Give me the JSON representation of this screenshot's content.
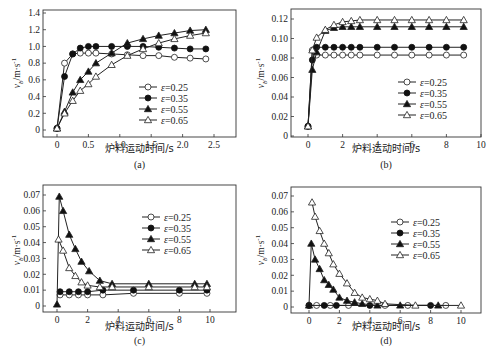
{
  "chart_data": [
    {
      "id": "a",
      "type": "line",
      "caption": "(a)",
      "xlabel": "炉料运动时间/s",
      "ylabel": "v_b/m·s^-1",
      "xlim": [
        -0.25,
        2.85
      ],
      "ylim": [
        -0.08,
        1.45
      ],
      "xticks": [
        0,
        0.5,
        1.0,
        1.5,
        2.0,
        2.5
      ],
      "xtick_labels": [
        "0",
        "0.5",
        "1.0",
        "1.5",
        "2.0",
        "2.5"
      ],
      "yticks": [
        0,
        0.2,
        0.4,
        0.6,
        0.8,
        1.0,
        1.2,
        1.4
      ],
      "ytick_labels": [
        "0",
        "0.2",
        "0.4",
        "0.6",
        "0.8",
        "1.0",
        "1.2",
        "1.4"
      ],
      "legend_position": "center-right",
      "series": [
        {
          "name": "ε=0.25",
          "marker": "open-circle",
          "x": [
            0,
            0.12,
            0.25,
            0.37,
            0.5,
            0.62,
            0.87,
            1.12,
            1.37,
            1.62,
            1.87,
            2.12,
            2.37
          ],
          "y": [
            0.02,
            0.8,
            0.91,
            0.92,
            0.92,
            0.92,
            0.91,
            0.9,
            0.89,
            0.89,
            0.87,
            0.86,
            0.85
          ]
        },
        {
          "name": "ε=0.35",
          "marker": "filled-circle",
          "x": [
            0,
            0.12,
            0.25,
            0.37,
            0.5,
            0.62,
            0.87,
            1.12,
            1.37,
            1.62,
            1.87,
            2.12,
            2.37
          ],
          "y": [
            0.02,
            0.64,
            0.91,
            0.98,
            1.0,
            1.0,
            1.0,
            1.0,
            1.0,
            0.99,
            0.98,
            0.97,
            0.97
          ]
        },
        {
          "name": "ε=0.55",
          "marker": "filled-triangle",
          "x": [
            0,
            0.12,
            0.25,
            0.37,
            0.5,
            0.62,
            0.87,
            1.12,
            1.37,
            1.62,
            1.87,
            2.12,
            2.37
          ],
          "y": [
            0.02,
            0.22,
            0.45,
            0.6,
            0.7,
            0.8,
            0.92,
            1.04,
            1.09,
            1.13,
            1.16,
            1.19,
            1.2
          ]
        },
        {
          "name": "ε=0.65",
          "marker": "open-triangle",
          "x": [
            0,
            0.12,
            0.25,
            0.37,
            0.5,
            0.62,
            0.87,
            1.12,
            1.37,
            1.62,
            1.87,
            2.12,
            2.37
          ],
          "y": [
            0.02,
            0.2,
            0.35,
            0.47,
            0.55,
            0.64,
            0.78,
            0.89,
            0.97,
            1.04,
            1.09,
            1.13,
            1.16
          ]
        }
      ]
    },
    {
      "id": "b",
      "type": "line",
      "caption": "(b)",
      "xlabel": "炉料运动时间/s",
      "ylabel": "v_b/m·s^-1",
      "xlim": [
        -1,
        10
      ],
      "ylim": [
        0,
        0.13
      ],
      "xticks": [
        0,
        2,
        4,
        6,
        8,
        10
      ],
      "xtick_labels": [
        "0",
        "2",
        "4",
        "6",
        "8",
        "10"
      ],
      "yticks": [
        0,
        0.02,
        0.04,
        0.06,
        0.08,
        0.1,
        0.12
      ],
      "ytick_labels": [
        "0",
        "0.02",
        "0.04",
        "0.06",
        "0.08",
        "0.10",
        "0.12"
      ],
      "legend_position": "lower-right",
      "series": [
        {
          "name": "ε=0.25",
          "marker": "open-circle",
          "x": [
            0,
            0.25,
            0.5,
            1,
            1.5,
            2,
            2.5,
            3,
            4,
            5,
            6,
            7,
            8,
            9
          ],
          "y": [
            0.01,
            0.088,
            0.083,
            0.083,
            0.083,
            0.083,
            0.083,
            0.083,
            0.083,
            0.083,
            0.083,
            0.083,
            0.083,
            0.083
          ]
        },
        {
          "name": "ε=0.35",
          "marker": "filled-circle",
          "x": [
            0,
            0.25,
            0.5,
            1,
            1.5,
            2,
            2.5,
            3,
            4,
            5,
            6,
            7,
            8,
            9
          ],
          "y": [
            0.01,
            0.078,
            0.091,
            0.091,
            0.091,
            0.091,
            0.091,
            0.091,
            0.091,
            0.091,
            0.091,
            0.091,
            0.091,
            0.091
          ]
        },
        {
          "name": "ε=0.55",
          "marker": "filled-triangle",
          "x": [
            0,
            0.25,
            0.5,
            1,
            1.5,
            2,
            2.5,
            3,
            4,
            5,
            6,
            7,
            8,
            9
          ],
          "y": [
            0.01,
            0.068,
            0.086,
            0.108,
            0.111,
            0.112,
            0.112,
            0.112,
            0.112,
            0.112,
            0.112,
            0.112,
            0.112,
            0.112
          ]
        },
        {
          "name": "ε=0.65",
          "marker": "open-triangle",
          "x": [
            0,
            0.25,
            0.5,
            1,
            1.5,
            2,
            2.5,
            3,
            4,
            5,
            6,
            7,
            8,
            9
          ],
          "y": [
            0.01,
            0.088,
            0.101,
            0.109,
            0.114,
            0.117,
            0.118,
            0.119,
            0.119,
            0.119,
            0.119,
            0.119,
            0.119,
            0.119
          ]
        }
      ]
    },
    {
      "id": "c",
      "type": "line",
      "caption": "(c)",
      "xlabel": "炉料运动时间/s",
      "ylabel": "v_b/m·s^-1",
      "xlim": [
        -1,
        11
      ],
      "ylim": [
        -0.004,
        0.075
      ],
      "xticks": [
        0,
        2,
        4,
        6,
        8,
        10
      ],
      "xtick_labels": [
        "0",
        "2",
        "4",
        "6",
        "8",
        "10"
      ],
      "yticks": [
        0,
        0.01,
        0.02,
        0.03,
        0.04,
        0.05,
        0.06,
        0.07
      ],
      "ytick_labels": [
        "0",
        "0.01",
        "0.02",
        "0.03",
        "0.04",
        "0.05",
        "0.06",
        "0.07"
      ],
      "legend_position": "upper-right",
      "series": [
        {
          "name": "ε=0.25",
          "marker": "open-circle",
          "x": [
            0.2,
            0.8,
            1.4,
            2,
            3,
            5,
            8,
            9.8
          ],
          "y": [
            0.007,
            0.007,
            0.007,
            0.007,
            0.007,
            0.008,
            0.008,
            0.008
          ]
        },
        {
          "name": "ε=0.35",
          "marker": "filled-circle",
          "x": [
            0.2,
            0.8,
            1.4,
            2,
            3,
            5,
            8,
            9.8
          ],
          "y": [
            0.009,
            0.009,
            0.009,
            0.009,
            0.01,
            0.01,
            0.01,
            0.01
          ]
        },
        {
          "name": "ε=0.55",
          "marker": "filled-triangle",
          "x": [
            0,
            0.15,
            0.4,
            0.8,
            1.2,
            1.6,
            2.1,
            2.8,
            3.6,
            6,
            9,
            9.8
          ],
          "y": [
            0.001,
            0.069,
            0.06,
            0.045,
            0.036,
            0.028,
            0.022,
            0.016,
            0.014,
            0.014,
            0.014,
            0.014
          ]
        },
        {
          "name": "ε=0.65",
          "marker": "open-triangle",
          "x": [
            0.1,
            0.4,
            0.8,
            1.2,
            1.6,
            2.0,
            2.8,
            3.6,
            6,
            9,
            9.8
          ],
          "y": [
            0.042,
            0.035,
            0.024,
            0.019,
            0.015,
            0.013,
            0.012,
            0.012,
            0.012,
            0.012,
            0.012
          ]
        }
      ]
    },
    {
      "id": "d",
      "type": "line",
      "caption": "(d)",
      "xlabel": "炉料运动时间/s",
      "ylabel": "v_b/m·s^-1",
      "xlim": [
        -1,
        11.3
      ],
      "ylim": [
        -0.004,
        0.073
      ],
      "xticks": [
        0,
        2,
        4,
        6,
        8,
        10
      ],
      "xtick_labels": [
        "0",
        "2",
        "4",
        "6",
        "8",
        "10"
      ],
      "yticks": [
        0,
        0.01,
        0.02,
        0.03,
        0.04,
        0.05,
        0.06,
        0.07
      ],
      "ytick_labels": [
        "0",
        "0.01",
        "0.02",
        "0.03",
        "0.04",
        "0.05",
        "0.06",
        "0.07"
      ],
      "legend_position": "upper-right",
      "series": [
        {
          "name": "ε=0.25",
          "marker": "open-circle",
          "x": [
            0,
            0.5,
            1.4,
            2.6,
            5,
            6.5,
            9
          ],
          "y": [
            0.001,
            0.001,
            0.001,
            0.001,
            0.001,
            0.001,
            0.001
          ]
        },
        {
          "name": "ε=0.35",
          "marker": "filled-circle",
          "x": [
            0,
            1.0,
            1.8,
            4,
            8
          ],
          "y": [
            0.001,
            0.001,
            0.001,
            0.001,
            0.001
          ]
        },
        {
          "name": "ε=0.55",
          "marker": "filled-triangle",
          "x": [
            0,
            0.15,
            0.4,
            0.7,
            1.0,
            1.3,
            1.6,
            2.0,
            2.5,
            3.0,
            3.5,
            4.5,
            6,
            8.5
          ],
          "y": [
            0.001,
            0.04,
            0.03,
            0.024,
            0.017,
            0.014,
            0.011,
            0.006,
            0.004,
            0.003,
            0.002,
            0.001,
            0.001,
            0.001
          ]
        },
        {
          "name": "ε=0.65",
          "marker": "open-triangle",
          "x": [
            0.2,
            0.4,
            0.7,
            1.0,
            1.3,
            1.6,
            2.0,
            2.5,
            3.0,
            3.5,
            4.0,
            4.5,
            5.0,
            7.0,
            10
          ],
          "y": [
            0.066,
            0.057,
            0.048,
            0.04,
            0.034,
            0.027,
            0.021,
            0.015,
            0.009,
            0.006,
            0.005,
            0.004,
            0.002,
            0.001,
            0.001
          ]
        }
      ]
    }
  ],
  "legend_labels": [
    "ε=0.25",
    "ε=0.35",
    "ε=0.55",
    "ε=0.65"
  ],
  "panels": {
    "a": {
      "caption": "(a)",
      "xlabel": "炉料运动时间/s"
    },
    "b": {
      "caption": "(b)",
      "xlabel": "炉料运动时间/s"
    },
    "c": {
      "caption": "(c)",
      "xlabel": "炉料运动时间/s"
    },
    "d": {
      "caption": "(d)",
      "xlabel": "炉料运动时间/s"
    }
  },
  "ylabel_main": "v",
  "ylabel_sub": "b",
  "ylabel_units": "/m·s",
  "ylabel_exp": "-1"
}
